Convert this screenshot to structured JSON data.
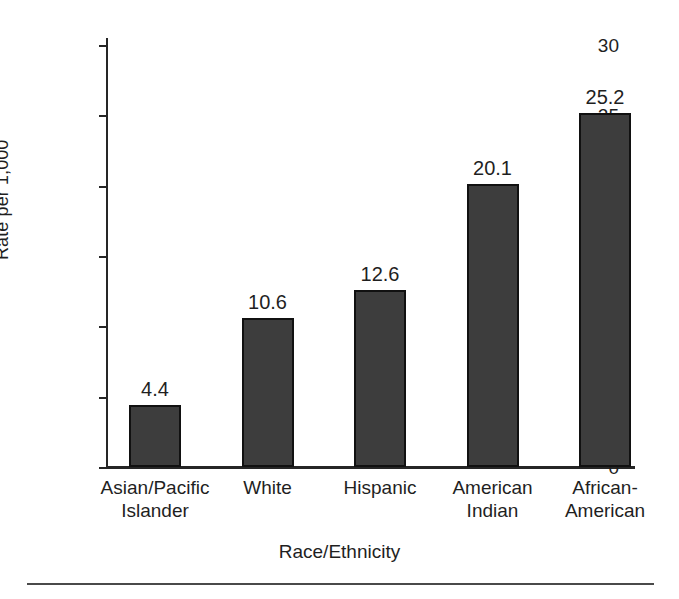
{
  "chart_data": {
    "type": "bar",
    "title": "",
    "subtitle": "",
    "xlabel": "Race/Ethnicity",
    "ylabel": "Rate per 1,000",
    "categories": [
      "Asian/Pacific\nIslander",
      "White",
      "Hispanic",
      "American\nIndian",
      "African-\nAmerican"
    ],
    "values": [
      4.4,
      10.6,
      12.6,
      20.1,
      25.2
    ],
    "value_labels": [
      "4.4",
      "10.6",
      "12.6",
      "20.1",
      "25.2"
    ],
    "ylim": [
      0,
      30
    ],
    "yticks": [
      0,
      5,
      10,
      15,
      20,
      25,
      30
    ],
    "ytick_labels": [
      "0",
      "5",
      "10",
      "15",
      "20",
      "25",
      "30"
    ],
    "grid": false,
    "legend": null,
    "bar_color": "#3d3d3d",
    "bar_edge_color": "#111111",
    "axis_color": "#262626",
    "background": "#ffffff"
  }
}
